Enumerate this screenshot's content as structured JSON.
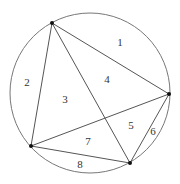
{
  "diagram": {
    "type": "circle-chord-partition",
    "circle": {
      "cx": 90,
      "cy": 93,
      "r": 80,
      "stroke": "#777777"
    },
    "points": [
      {
        "id": "A",
        "x": 52,
        "y": 23
      },
      {
        "id": "B",
        "x": 169,
        "y": 94
      },
      {
        "id": "C",
        "x": 130,
        "y": 163
      },
      {
        "id": "D",
        "x": 31,
        "y": 146
      }
    ],
    "chords": [
      {
        "from": "A",
        "to": "B"
      },
      {
        "from": "A",
        "to": "C"
      },
      {
        "from": "A",
        "to": "D"
      },
      {
        "from": "B",
        "to": "C"
      },
      {
        "from": "B",
        "to": "D"
      },
      {
        "from": "C",
        "to": "D"
      }
    ],
    "chord_color": "#555555",
    "point_color": "#111111",
    "regions": [
      {
        "label": "1",
        "x": 120,
        "y": 46
      },
      {
        "label": "2",
        "x": 27,
        "y": 86
      },
      {
        "label": "3",
        "x": 65,
        "y": 103
      },
      {
        "label": "4",
        "x": 107,
        "y": 83
      },
      {
        "label": "5",
        "x": 131,
        "y": 129
      },
      {
        "label": "6",
        "x": 153,
        "y": 135
      },
      {
        "label": "7",
        "x": 88,
        "y": 145
      },
      {
        "label": "8",
        "x": 80,
        "y": 168
      }
    ]
  }
}
